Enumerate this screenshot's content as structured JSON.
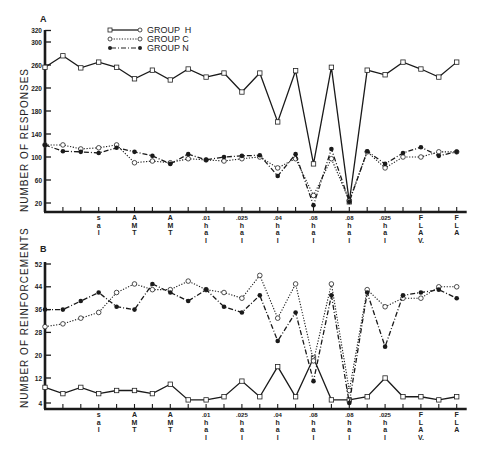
{
  "chart_data": [
    {
      "type": "line",
      "panel_label": "A",
      "title": "",
      "xlabel": "",
      "ylabel": "NUMBER OF RESPONSES",
      "ylim": [
        0,
        320
      ],
      "yticks": [
        20,
        60,
        100,
        140,
        180,
        220,
        260,
        300,
        320
      ],
      "grid": false,
      "legend_position": "top-left-inside",
      "x": [
        1,
        2,
        3,
        4,
        5,
        6,
        7,
        8,
        9,
        10,
        11,
        12,
        13,
        14,
        15,
        16,
        17,
        18,
        19,
        20,
        21,
        22,
        23,
        24
      ],
      "tick_labels": {
        "4": "sal",
        "6": "AMT",
        "8": "AMT",
        "10": ".01 hal",
        "12": ".025 hal",
        "14": ".04 hal",
        "16": ".08 hal",
        "18": ".08 hal",
        "20": ".025 hal",
        "22": "FLAV",
        "24": "FLA"
      },
      "series": [
        {
          "name": "GROUP H",
          "marker": "square-open",
          "line": "solid",
          "values": [
            256,
            276,
            255,
            265,
            256,
            236,
            251,
            234,
            253,
            239,
            246,
            213,
            246,
            161,
            250,
            88,
            256,
            22,
            251,
            243,
            265,
            253,
            239,
            265
          ]
        },
        {
          "name": "GROUP C",
          "marker": "circle-open",
          "line": "dotted",
          "values": [
            121,
            121,
            114,
            116,
            121,
            90,
            93,
            90,
            97,
            95,
            93,
            97,
            100,
            81,
            97,
            33,
            97,
            24,
            109,
            81,
            100,
            100,
            109,
            109
          ]
        },
        {
          "name": "GROUP N",
          "marker": "circle-filled",
          "line": "dash-dot",
          "values": [
            121,
            110,
            109,
            107,
            116,
            109,
            102,
            88,
            105,
            95,
            100,
            102,
            103,
            67,
            105,
            16,
            114,
            22,
            110,
            88,
            107,
            117,
            102,
            109
          ]
        }
      ]
    },
    {
      "type": "line",
      "panel_label": "B",
      "title": "",
      "xlabel": "",
      "ylabel": "NUMBER OF REINFORCEMENTS",
      "ylim": [
        0,
        52
      ],
      "yticks": [
        4,
        12,
        20,
        28,
        36,
        44,
        52
      ],
      "grid": false,
      "x": [
        1,
        2,
        3,
        4,
        5,
        6,
        7,
        8,
        9,
        10,
        11,
        12,
        13,
        14,
        15,
        16,
        17,
        18,
        19,
        20,
        21,
        22,
        23,
        24
      ],
      "tick_labels": {
        "4": "sal",
        "6": "AMT",
        "8": "AMT",
        "10": ".01 hal",
        "12": ".025 hal",
        "14": ".04 hal",
        "16": ".08 hal",
        "18": ".08 hal",
        "20": ".025 hal",
        "22": "FLAV",
        "24": "FLA"
      },
      "series": [
        {
          "name": "GROUP H",
          "marker": "square-open",
          "line": "solid",
          "values": [
            9,
            7,
            9,
            7,
            8,
            8,
            7,
            10,
            5,
            5,
            6,
            11,
            6,
            16,
            6,
            19,
            5,
            5,
            6,
            12,
            6,
            6,
            5,
            6
          ]
        },
        {
          "name": "GROUP C",
          "marker": "circle-open",
          "line": "dotted",
          "values": [
            30,
            31,
            33,
            35,
            42,
            45,
            43,
            43,
            46,
            43,
            42,
            40,
            48,
            33,
            45,
            18,
            45,
            8,
            43,
            37,
            40,
            40,
            44,
            44
          ]
        },
        {
          "name": "GROUP N",
          "marker": "circle-filled",
          "line": "dash-dot",
          "values": [
            36,
            36,
            39,
            42,
            37,
            36,
            45,
            42,
            39,
            43,
            37,
            35,
            41,
            25,
            35,
            11,
            41,
            4,
            42,
            23,
            41,
            42,
            43,
            40
          ]
        }
      ]
    }
  ],
  "legend": {
    "items": [
      {
        "label": "GROUP  H"
      },
      {
        "label": "GROUP  C"
      },
      {
        "label": "GROUP  N"
      }
    ]
  },
  "panels": {
    "a": {
      "label": "A",
      "ylabel": "NUMBER OF RESPONSES"
    },
    "b": {
      "label": "B",
      "ylabel": "NUMBER OF REINFORCEMENTS"
    }
  }
}
